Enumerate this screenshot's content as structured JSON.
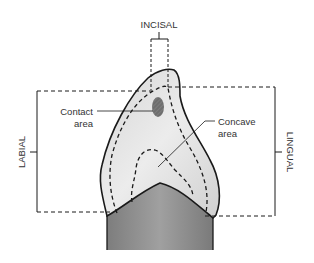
{
  "diagram": {
    "title_labels": {
      "incisal": "INCISAL",
      "labial": "LABIAL",
      "lingual": "LINGUAL"
    },
    "callouts": {
      "contact": {
        "line1": "Contact",
        "line2": "area"
      },
      "concave": {
        "line1": "Concave",
        "line2": "area"
      }
    },
    "colors": {
      "outline": "#1a1a1a",
      "crown_fill": "#e4e4e4",
      "crown_highlight": "#f3f3f3",
      "root_fill": "#8c8c8c",
      "contact_fill": "#6e6e6e",
      "text": "#333333"
    }
  }
}
